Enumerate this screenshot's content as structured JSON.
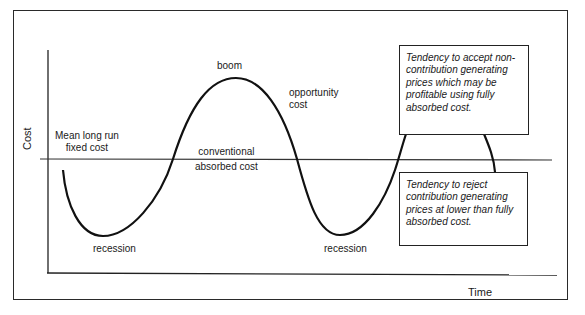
{
  "diagram": {
    "type": "business-cycle-cost-curve",
    "axes": {
      "y_label": "Cost",
      "x_label": "Time"
    },
    "reference_line": {
      "left_label_line1": "Mean long run",
      "left_label_line2": "fixed cost",
      "center_label_line1": "conventional",
      "center_label_line2": "absorbed cost"
    },
    "curve_labels": {
      "peak": "boom",
      "trough_1": "recession",
      "trough_2": "recession",
      "opportunity_line1": "opportunity",
      "opportunity_line2": "cost"
    },
    "callouts": {
      "upper": {
        "lines": [
          "Tendency to accept non-",
          "contribution generating",
          "prices which may be",
          "profitable using fully",
          "absorbed cost."
        ]
      },
      "lower": {
        "lines": [
          "Tendency to reject",
          "contribution generating",
          "prices at lower than fully",
          "absorbed cost."
        ]
      }
    },
    "colors": {
      "line": "#1a1a1a",
      "background": "#ffffff"
    }
  }
}
